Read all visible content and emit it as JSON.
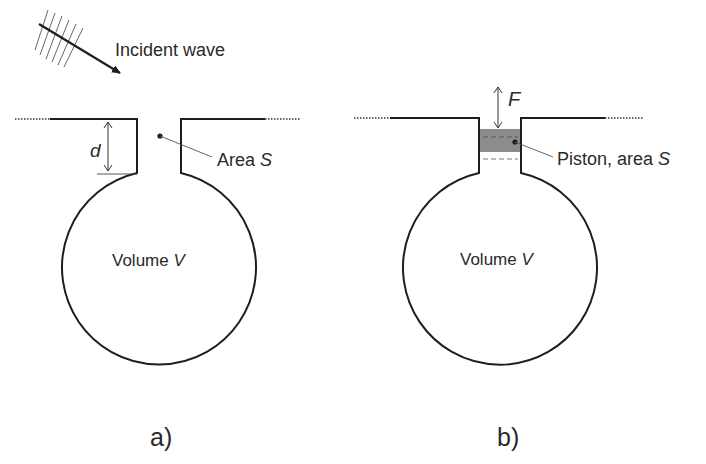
{
  "figure": {
    "panel_a": {
      "caption": "a)",
      "incident_wave_label": "Incident wave",
      "dimension_label": "d",
      "area_label_prefix": "Area ",
      "area_label_symbol": "S",
      "volume_label_prefix": "Volume ",
      "volume_label_symbol": "V"
    },
    "panel_b": {
      "caption": "b)",
      "force_label": "F",
      "piston_label_prefix": "Piston, area ",
      "piston_label_symbol": "S",
      "volume_label_prefix": "Volume ",
      "volume_label_symbol": "V"
    },
    "colors": {
      "stroke": "#1e1e1e",
      "thin_stroke": "#4a4a4a",
      "piston_fill": "#8c8c8c",
      "text": "#2a2a2a"
    }
  }
}
